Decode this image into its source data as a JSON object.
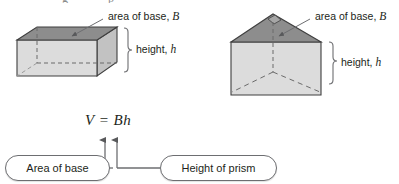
{
  "figure": {
    "formula": "V = Bh",
    "left_shape": {
      "name": "rectangular prism",
      "base_label": "area of base, ",
      "base_symbol": "B",
      "height_label": "height, ",
      "height_symbol": "h"
    },
    "right_shape": {
      "name": "triangular prism",
      "base_label": "area of base, ",
      "base_symbol": "B",
      "height_label": "height, ",
      "height_symbol": "h"
    },
    "callouts": [
      {
        "label": "Area of base",
        "points_to": "B"
      },
      {
        "label": "Height of prism",
        "points_to": "h"
      }
    ],
    "colors": {
      "base_face": "#8c8c8c",
      "front_face": "#d9d9d9",
      "side_face": "#c4c4c4",
      "outline": "#3f3f3f",
      "leader": "#6d6e71",
      "text": "#231f20"
    }
  }
}
